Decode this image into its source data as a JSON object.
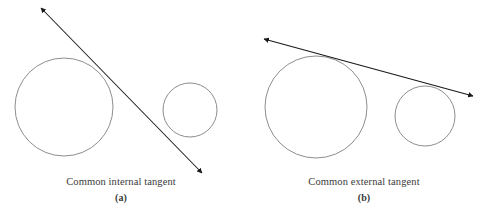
{
  "figure": {
    "background_color": "#ffffff",
    "circle_stroke_color": "#808080",
    "tangent_line_color": "#1a1a1a",
    "caption_text_color": "#3a3a3a",
    "panels": [
      {
        "id": "a",
        "caption": "Common internal tangent",
        "label": "(a)",
        "tangent_type": "internal",
        "circles": [
          {
            "name": "large-circle",
            "cx": 64,
            "cy": 107,
            "r": 49
          },
          {
            "name": "small-circle",
            "cx": 190,
            "cy": 110,
            "r": 27
          }
        ],
        "tangent_line": {
          "x1": 41,
          "y1": 8,
          "x2": 202,
          "y2": 173,
          "arrow_start": true,
          "arrow_end": true
        },
        "tangency_points": [
          {
            "x": 100,
            "y": 72
          },
          {
            "x": 168,
            "y": 131
          }
        ]
      },
      {
        "id": "b",
        "caption": "Common external tangent",
        "label": "(b)",
        "tangent_type": "external",
        "circles": [
          {
            "name": "large-circle",
            "cx": 73,
            "cy": 107,
            "r": 51
          },
          {
            "name": "small-circle",
            "cx": 182,
            "cy": 116,
            "r": 30
          }
        ],
        "tangent_line": {
          "x1": 21,
          "y1": 39,
          "x2": 230,
          "y2": 96,
          "arrow_start": true,
          "arrow_end": true
        },
        "tangency_points": [
          {
            "x": 75,
            "y": 56
          },
          {
            "x": 182,
            "y": 88
          }
        ]
      }
    ]
  }
}
